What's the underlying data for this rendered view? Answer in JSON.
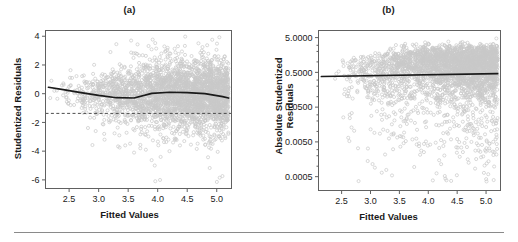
{
  "figure": {
    "background": "#ffffff",
    "point_color": "#c8c8c8",
    "line_color": "#1a1a1a",
    "axis_color": "#555555",
    "footer_rule_color": "#8a8a8a"
  },
  "panels": {
    "a": {
      "title": "(a)",
      "xlabel": "Fitted Values",
      "ylabel": "Studentized Residuals"
    },
    "b": {
      "title": "(b)",
      "xlabel": "Fitted Values",
      "ylabel_line1": "Absolute Studentized",
      "ylabel_line2": "Residuals"
    }
  },
  "chart_data": [
    {
      "panel": "a",
      "type": "scatter",
      "title": "(a)",
      "xlabel": "Fitted Values",
      "ylabel": "Studentized Residuals",
      "xticks": [
        2.5,
        3.0,
        3.5,
        4.0,
        4.5,
        5.0
      ],
      "xticklabels": [
        "2.5",
        "3.0",
        "3.5",
        "4.0",
        "4.5",
        "5.0"
      ],
      "yticks": [
        4,
        2,
        0,
        -2,
        -4,
        -6
      ],
      "yticklabels": [
        "4",
        "2",
        "0",
        "-2",
        "-4",
        "-6"
      ],
      "xlim": [
        2.1,
        5.25
      ],
      "ylim": [
        -6.6,
        4.4
      ],
      "yscale": "linear",
      "grid": false,
      "legend": "none",
      "marker": "open-circle",
      "marker_color": "#c8c8c8",
      "n_points_approx": 3000,
      "point_cloud": {
        "description": "Dense gray open-circle cloud of studentized residuals against fitted values; widest and densest between fitted 3.5 and 5.0 centered near 0, thinning to the left, with a long lower tail of outliers reaching -6.",
        "x_range": [
          2.15,
          5.2
        ],
        "y_core_range": [
          -1.6,
          1.6
        ],
        "density_peak_x": 4.3,
        "outlier_y_min": -6.0,
        "outlier_y_max": 3.8
      },
      "reference_line": {
        "type": "dashed-horizontal",
        "y": 0,
        "color": "#333333"
      },
      "smoother": {
        "type": "lowess",
        "color": "#1a1a1a",
        "x": [
          2.15,
          2.4,
          2.7,
          3.0,
          3.3,
          3.6,
          3.9,
          4.2,
          4.5,
          4.8,
          5.1,
          5.2
        ],
        "y": [
          0.45,
          0.28,
          0.08,
          -0.12,
          -0.28,
          -0.3,
          0.02,
          0.1,
          0.08,
          0.0,
          -0.2,
          -0.3
        ]
      }
    },
    {
      "panel": "b",
      "type": "scatter",
      "title": "(b)",
      "xlabel": "Fitted Values",
      "ylabel": "Absolute Studentized Residuals",
      "xticks": [
        2.5,
        3.0,
        3.5,
        4.0,
        4.5,
        5.0
      ],
      "xticklabels": [
        "2.5",
        "3.0",
        "3.5",
        "4.0",
        "4.5",
        "5.0"
      ],
      "yticks": [
        5.0,
        0.5,
        0.05,
        0.005,
        0.0005
      ],
      "yticklabels": [
        "5.0000",
        "0.5000",
        "0.0500",
        "0.0050",
        "0.0005"
      ],
      "xlim": [
        2.1,
        5.25
      ],
      "ylim": [
        0.0002,
        8.0
      ],
      "yscale": "log",
      "grid": false,
      "legend": "none",
      "marker": "open-circle",
      "marker_color": "#c8c8c8",
      "n_points_approx": 3000,
      "point_cloud": {
        "description": "Gray open-circle cloud of absolute studentized residuals on a log y-axis versus fitted values; dense band between 0.1 and 3 across fitted 3.5 to 5.2, with a downward spray of small residuals toward 0.0005 concentrated near fitted 3.5 to 4.5.",
        "x_range": [
          2.2,
          5.2
        ],
        "y_core_range": [
          0.1,
          3.0
        ],
        "y_tail_min": 0.0005,
        "y_max": 5.0
      },
      "fit_line": {
        "type": "linear",
        "color": "#1a1a1a",
        "x": [
          2.15,
          5.2
        ],
        "y": [
          0.38,
          0.46
        ]
      }
    }
  ]
}
